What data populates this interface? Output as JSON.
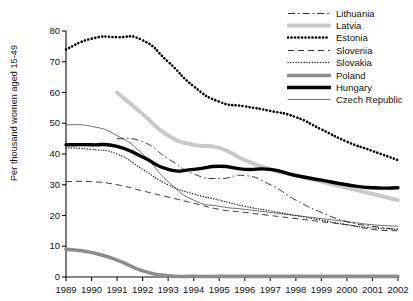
{
  "chart_data": {
    "type": "line",
    "title": "",
    "xlabel": "",
    "ylabel": "Per thousand women aged 15-49",
    "x": [
      1989,
      1990,
      1991,
      1992,
      1993,
      1994,
      1995,
      1996,
      1997,
      1998,
      1999,
      2000,
      2001,
      2002
    ],
    "xlim": [
      1989,
      2002
    ],
    "ylim": [
      0,
      80
    ],
    "yticks": [
      0,
      10,
      20,
      30,
      40,
      50,
      60,
      70,
      80
    ],
    "xticks": [
      "1989",
      "1990",
      "1991",
      "1992",
      "1993",
      "1994",
      "1995",
      "1996",
      "1997",
      "1998",
      "1999",
      "2000",
      "2001",
      "2002"
    ],
    "grid": false,
    "legend_position": "top-right",
    "series": [
      {
        "name": "Lithuania",
        "style": "dash-dot",
        "color": "#333333",
        "width": 1,
        "x": [
          1991,
          1992,
          1993,
          1994,
          1995,
          1996,
          1997,
          1998,
          1999,
          2000,
          2001,
          2002
        ],
        "values": [
          45.0,
          44.0,
          38.5,
          33.5,
          32.0,
          33.0,
          30.0,
          25.0,
          21.0,
          18.0,
          16.5,
          15.5
        ]
      },
      {
        "name": "Latvia",
        "style": "solid",
        "color": "#c9c9c9",
        "width": 4,
        "x": [
          1991,
          1992,
          1993,
          1994,
          1995,
          1996,
          1997,
          1998,
          1999,
          2000,
          2001,
          2002
        ],
        "values": [
          60.0,
          53.0,
          46.0,
          43.0,
          42.0,
          38.0,
          35.0,
          33.0,
          31.0,
          29.0,
          27.0,
          25.0
        ]
      },
      {
        "name": "Estonia",
        "style": "dotted-thick",
        "color": "#000000",
        "width": 2.6,
        "x": [
          1989,
          1990,
          1991,
          1992,
          1993,
          1994,
          1995,
          1996,
          1997,
          1998,
          1999,
          2000,
          2001,
          2002
        ],
        "values": [
          74.0,
          77.5,
          78.0,
          77.0,
          70.0,
          62.0,
          57.0,
          55.5,
          54.0,
          52.0,
          48.0,
          44.0,
          41.0,
          38.0
        ]
      },
      {
        "name": "Slovenia",
        "style": "dashed",
        "color": "#333333",
        "width": 1,
        "x": [
          1989,
          1990,
          1991,
          1992,
          1993,
          1994,
          1995,
          1996,
          1997,
          1998,
          1999,
          2000,
          2001,
          2002
        ],
        "values": [
          31.0,
          31.0,
          30.0,
          28.0,
          26.0,
          24.0,
          22.0,
          21.0,
          20.0,
          19.0,
          18.0,
          17.0,
          15.5,
          15.0
        ]
      },
      {
        "name": "Slovakia",
        "style": "dotted",
        "color": "#222222",
        "width": 1.4,
        "x": [
          1989,
          1990,
          1991,
          1992,
          1993,
          1994,
          1995,
          1996,
          1997,
          1998,
          1999,
          2000,
          2001,
          2002
        ],
        "values": [
          42.0,
          41.5,
          40.0,
          35.0,
          30.0,
          27.0,
          25.0,
          23.0,
          21.5,
          20.0,
          18.5,
          17.0,
          16.0,
          15.5
        ]
      },
      {
        "name": "Poland",
        "style": "solid",
        "color": "#8c8c8c",
        "width": 3.6,
        "x": [
          1989,
          1990,
          1991,
          1992,
          1993,
          1994,
          1995,
          1996,
          1997,
          1998,
          1999,
          2000,
          2001,
          2002
        ],
        "values": [
          9.0,
          8.0,
          5.5,
          2.0,
          0.4,
          0.2,
          0.2,
          0.2,
          0.2,
          0.2,
          0.2,
          0.2,
          0.2,
          0.2
        ]
      },
      {
        "name": "Hungary",
        "style": "solid",
        "color": "#000000",
        "width": 3.4,
        "x": [
          1989,
          1990,
          1991,
          1992,
          1993,
          1994,
          1995,
          1996,
          1997,
          1998,
          1999,
          2000,
          2001,
          2002
        ],
        "values": [
          43.0,
          43.0,
          42.5,
          39.0,
          35.0,
          35.0,
          36.0,
          35.0,
          35.0,
          33.0,
          31.5,
          30.0,
          29.0,
          29.0
        ]
      },
      {
        "name": "Czech Republic",
        "style": "solid",
        "color": "#6e6e6e",
        "width": 1,
        "x": [
          1989,
          1990,
          1991,
          1992,
          1993,
          1994,
          1995,
          1996,
          1997,
          1998,
          1999,
          2000,
          2001,
          2002
        ],
        "values": [
          49.5,
          49.0,
          46.0,
          40.0,
          31.0,
          25.0,
          23.0,
          22.0,
          21.0,
          20.0,
          19.0,
          18.0,
          17.0,
          16.5
        ]
      }
    ]
  },
  "axis": {
    "y_label": "Per thousand women aged 15-49"
  }
}
